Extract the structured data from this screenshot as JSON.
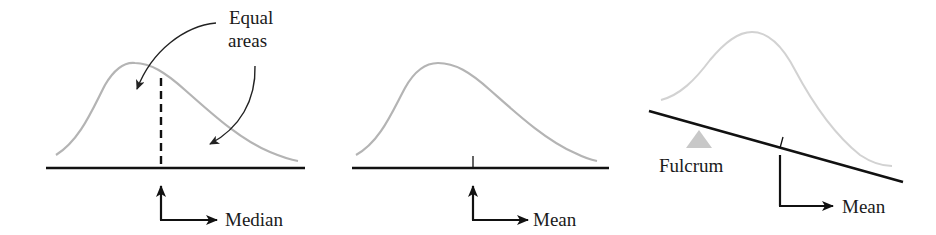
{
  "figure": {
    "panels": [
      {
        "id": "median-panel",
        "annotation_line1": "Equal",
        "annotation_line2": "areas",
        "indicator_label": "Median",
        "marker": "dashed vertical line"
      },
      {
        "id": "mean-panel",
        "indicator_label": "Mean",
        "marker": "tick mark"
      },
      {
        "id": "balance-panel",
        "support_label": "Fulcrum",
        "indicator_label": "Mean",
        "marker": "tick mark on tilted beam"
      }
    ],
    "colors": {
      "curve": "#b4b4b4",
      "curve_light": "#d2d2d2",
      "lines": "#111111",
      "fulcrum": "#c8c8c8"
    }
  }
}
